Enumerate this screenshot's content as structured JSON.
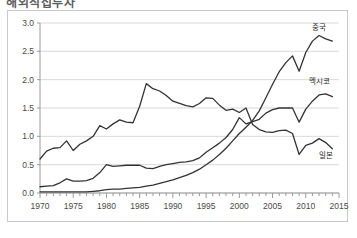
{
  "title": {
    "text": "해외직접투자",
    "note": "cut-off header text at top edge"
  },
  "colors": {
    "series_line": "#333333",
    "gridline": "#d9d9d9",
    "axis": "#9a9a9a",
    "frame_border": "#c9c9c9",
    "background": "#ffffff",
    "tick_label": "#4a4a4a"
  },
  "chart_data": {
    "type": "line",
    "title": "",
    "xlabel": "",
    "ylabel": "",
    "xlim": [
      1970,
      2015
    ],
    "ylim": [
      0.0,
      3.0
    ],
    "grid": true,
    "legend_position": "inline-end-of-line",
    "y_ticks": [
      "0.0",
      "0.5",
      "1.0",
      "1.5",
      "2.0",
      "2.5",
      "3.0"
    ],
    "y_tick_values": [
      0.0,
      0.5,
      1.0,
      1.5,
      2.0,
      2.5,
      3.0
    ],
    "x_ticks": [
      "1970",
      "1975",
      "1980",
      "1985",
      "1990",
      "1995",
      "2000",
      "2005",
      "2010",
      "2015"
    ],
    "x_tick_values": [
      1970,
      1975,
      1980,
      1985,
      1990,
      1995,
      2000,
      2005,
      2010,
      2015
    ],
    "x_minor_tick_step": 1,
    "x": [
      1970,
      1971,
      1972,
      1973,
      1974,
      1975,
      1976,
      1977,
      1978,
      1979,
      1980,
      1981,
      1982,
      1983,
      1984,
      1985,
      1986,
      1987,
      1988,
      1989,
      1990,
      1991,
      1992,
      1993,
      1994,
      1995,
      1996,
      1997,
      1998,
      1999,
      2000,
      2001,
      2002,
      2003,
      2004,
      2005,
      2006,
      2007,
      2008,
      2009,
      2010,
      2011,
      2012,
      2013,
      2014
    ],
    "series": [
      {
        "name": "중국",
        "name_en": "China",
        "label_year": 2012,
        "label_value": 2.88,
        "values": [
          0.02,
          0.02,
          0.02,
          0.02,
          0.02,
          0.02,
          0.02,
          0.02,
          0.03,
          0.04,
          0.06,
          0.07,
          0.07,
          0.08,
          0.09,
          0.1,
          0.12,
          0.14,
          0.17,
          0.2,
          0.23,
          0.27,
          0.31,
          0.36,
          0.42,
          0.5,
          0.58,
          0.68,
          0.79,
          0.92,
          1.05,
          1.16,
          1.28,
          1.45,
          1.68,
          1.92,
          2.14,
          2.3,
          2.42,
          2.15,
          2.48,
          2.68,
          2.78,
          2.72,
          2.68
        ]
      },
      {
        "name": "멕시코",
        "name_en": "Mexico",
        "label_year": 2012,
        "label_value": 1.92,
        "values": [
          0.11,
          0.12,
          0.13,
          0.18,
          0.25,
          0.21,
          0.21,
          0.22,
          0.26,
          0.36,
          0.5,
          0.47,
          0.48,
          0.49,
          0.49,
          0.49,
          0.44,
          0.43,
          0.47,
          0.5,
          0.52,
          0.54,
          0.55,
          0.57,
          0.62,
          0.72,
          0.8,
          0.88,
          0.98,
          1.12,
          1.33,
          1.22,
          1.26,
          1.3,
          1.41,
          1.47,
          1.5,
          1.5,
          1.5,
          1.25,
          1.48,
          1.62,
          1.73,
          1.75,
          1.7
        ]
      },
      {
        "name": "일본",
        "name_en": "Japan",
        "label_year": 2013,
        "label_value": 0.62,
        "values": [
          0.6,
          0.74,
          0.79,
          0.8,
          0.92,
          0.75,
          0.86,
          0.92,
          1.0,
          1.19,
          1.13,
          1.22,
          1.29,
          1.25,
          1.24,
          1.53,
          1.93,
          1.84,
          1.8,
          1.72,
          1.62,
          1.58,
          1.54,
          1.52,
          1.58,
          1.68,
          1.67,
          1.55,
          1.46,
          1.48,
          1.42,
          1.5,
          1.21,
          1.12,
          1.08,
          1.07,
          1.1,
          1.11,
          1.05,
          0.68,
          0.84,
          0.88,
          0.96,
          0.89,
          0.78
        ]
      }
    ]
  }
}
